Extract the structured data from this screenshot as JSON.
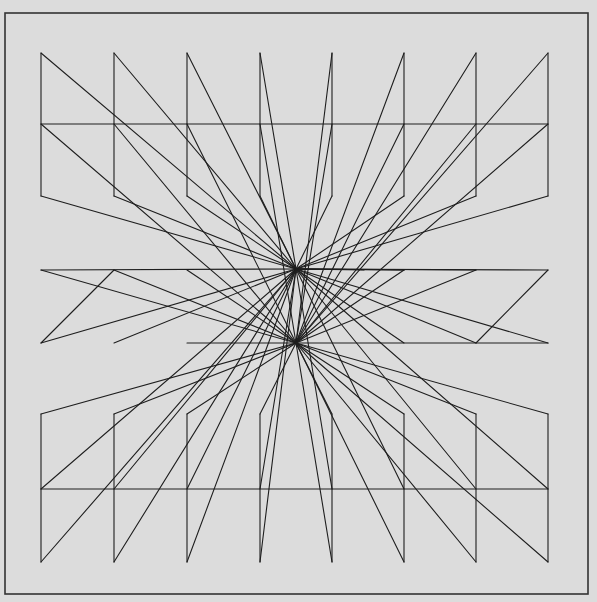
{
  "artwork": {
    "title": "Plotter line drawing — symmetric radial composition",
    "colors": {
      "paper": "#dcdcdc",
      "ink": "#1e1e1e",
      "frame": "#333333"
    },
    "frame": {
      "x": 5,
      "y": 13,
      "width": 583,
      "height": 581
    },
    "hubs": [
      {
        "x": 296,
        "y": 269
      },
      {
        "x": 296,
        "y": 343
      }
    ],
    "columns_x": [
      41,
      114,
      187,
      260,
      332,
      404,
      476,
      548
    ],
    "top_band_y": [
      53,
      124,
      196
    ],
    "middle_band_y": [
      270,
      343
    ],
    "bottom_band_y": [
      414,
      489,
      562
    ]
  }
}
